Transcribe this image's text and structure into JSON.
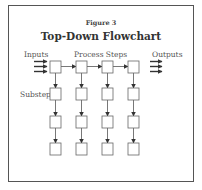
{
  "figure": {
    "label": "Figure 3",
    "title": "Top-Down Flowchart"
  },
  "labels": {
    "inputs": "Inputs",
    "process_steps": "Process Steps",
    "outputs": "Outputs",
    "substeps": "Substeps"
  },
  "colors": {
    "line": "#555555",
    "box_stroke": "#666666",
    "frame": "#555555",
    "background": "#ffffff"
  },
  "diagram": {
    "columns_x": [
      50,
      76,
      102,
      128
    ],
    "rows_y": [
      61,
      88,
      116,
      143
    ],
    "box_size": 11,
    "input_arrows": 3,
    "output_arrows": 3,
    "process_steps_count": 4,
    "substep_rows": 3
  }
}
